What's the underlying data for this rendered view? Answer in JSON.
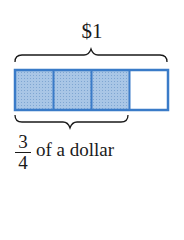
{
  "diagram": {
    "whole_label": "$1",
    "parts_total": 4,
    "parts_shaded": 3,
    "fraction": {
      "numerator": "3",
      "denominator": "4"
    },
    "fraction_suffix": "of a dollar",
    "colors": {
      "border": "#3a7bc8",
      "shaded_fill": "#9dbde0",
      "unshaded_fill": "#ffffff",
      "brace": "#1a1a1a"
    }
  }
}
